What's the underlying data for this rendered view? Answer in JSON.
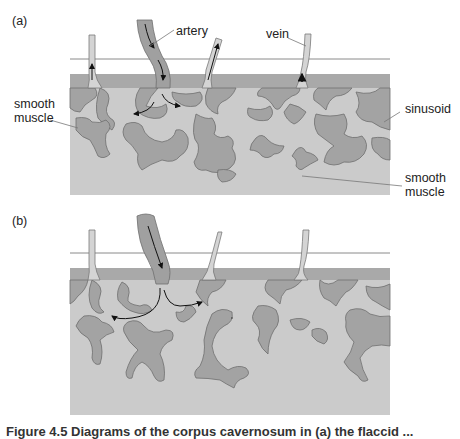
{
  "figure": {
    "panel_a": {
      "label": "(a)",
      "annotations": {
        "artery": "artery",
        "vein": "vein",
        "sinusoid": "sinusoid",
        "smooth_muscle_left_1": "smooth",
        "smooth_muscle_left_2": "muscle",
        "smooth_muscle_right_1": "smooth",
        "smooth_muscle_right_2": "muscle"
      }
    },
    "panel_b": {
      "label": "(b)"
    },
    "caption": "Figure 4.5  Diagrams of the corpus cavernosum in (a) the flaccid ..."
  },
  "colors": {
    "tissue_light": "#cbcbcb",
    "tissue_band": "#a9a9a9",
    "muscle": "#a3a3a3",
    "outline": "#6e6e6e",
    "vessel_fill": "#d4d4d4",
    "artery_fill": "#a0a0a0"
  }
}
